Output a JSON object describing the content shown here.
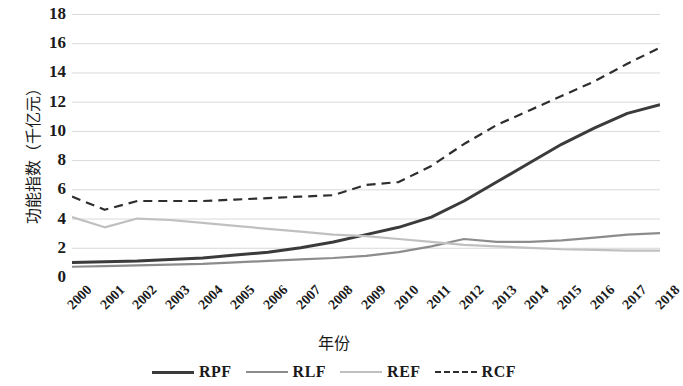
{
  "chart_data": {
    "type": "line",
    "title": "",
    "xlabel": "年份",
    "ylabel": "功能指数（千亿元）",
    "x": [
      "2000",
      "2001",
      "2002",
      "2003",
      "2004",
      "2005",
      "2006",
      "2007",
      "2008",
      "2009",
      "2010",
      "2011",
      "2012",
      "2013",
      "2014",
      "2015",
      "2016",
      "2017",
      "2018"
    ],
    "categories": [
      "2000",
      "2001",
      "2002",
      "2003",
      "2004",
      "2005",
      "2006",
      "2007",
      "2008",
      "2009",
      "2010",
      "2011",
      "2012",
      "2013",
      "2014",
      "2015",
      "2016",
      "2017",
      "2018"
    ],
    "ylim": [
      0,
      18
    ],
    "yticks": [
      0,
      2,
      4,
      6,
      8,
      10,
      12,
      14,
      16,
      18
    ],
    "ytick_labels": [
      "0",
      "2",
      "4",
      "6",
      "8",
      "10",
      "12",
      "14",
      "16",
      "18"
    ],
    "grid": true,
    "grid_axis": "y",
    "legend_position": "bottom",
    "series": [
      {
        "name": "RPF",
        "color": "#3b3b3b",
        "width": 3.0,
        "dash": "none",
        "values": [
          1.0,
          1.05,
          1.1,
          1.2,
          1.3,
          1.5,
          1.7,
          2.0,
          2.4,
          2.9,
          3.4,
          4.1,
          5.2,
          6.5,
          7.8,
          9.1,
          10.2,
          11.2,
          11.8
        ]
      },
      {
        "name": "RLF",
        "color": "#8c8c8c",
        "width": 2.2,
        "dash": "none",
        "values": [
          0.7,
          0.75,
          0.8,
          0.85,
          0.9,
          1.0,
          1.1,
          1.2,
          1.3,
          1.45,
          1.7,
          2.1,
          2.6,
          2.4,
          2.4,
          2.5,
          2.7,
          2.9,
          3.0
        ]
      },
      {
        "name": "REF",
        "color": "#c0c0c0",
        "width": 2.2,
        "dash": "none",
        "values": [
          4.1,
          3.4,
          4.0,
          3.9,
          3.7,
          3.5,
          3.3,
          3.1,
          2.9,
          2.8,
          2.6,
          2.4,
          2.2,
          2.1,
          2.0,
          1.9,
          1.85,
          1.8,
          1.8
        ]
      },
      {
        "name": "RCF",
        "color": "#2e2e2e",
        "width": 2.2,
        "dash": "9,6",
        "values": [
          5.5,
          4.6,
          5.2,
          5.2,
          5.2,
          5.3,
          5.4,
          5.5,
          5.6,
          6.3,
          6.5,
          7.6,
          9.1,
          10.4,
          11.4,
          12.4,
          13.4,
          14.6,
          15.7
        ]
      }
    ]
  },
  "legend": {
    "items": [
      {
        "label": "RPF"
      },
      {
        "label": "RLF"
      },
      {
        "label": "REF"
      },
      {
        "label": "RCF"
      }
    ]
  },
  "axes": {
    "y_title": "功能指数（千亿元）",
    "x_title": "年份"
  },
  "colors": {
    "grid": "#d9d9d9",
    "text": "#1a1a1a",
    "background": "#ffffff"
  }
}
